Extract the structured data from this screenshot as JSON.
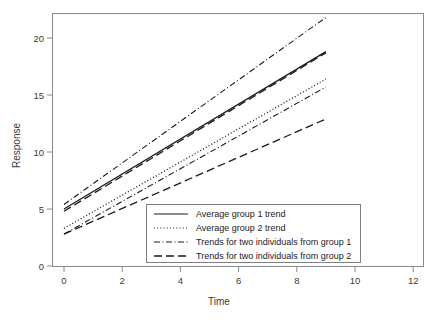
{
  "chart_data": {
    "type": "line",
    "title": "",
    "xlabel": "Time",
    "ylabel": "Response",
    "xlim": [
      -0.45,
      12.8
    ],
    "ylim": [
      -0.9,
      22.4
    ],
    "xticks": [
      0,
      2,
      4,
      6,
      8,
      10,
      12
    ],
    "yticks": [
      0,
      5,
      10,
      15,
      20
    ],
    "grid": false,
    "legend_position": "lower center",
    "x": [
      0,
      9
    ],
    "series": [
      {
        "name": "Average group 1 trend",
        "style": "solid",
        "values": [
          5.0,
          18.8
        ]
      },
      {
        "name": "Average group 2 trend",
        "style": "dotted",
        "values": [
          3.3,
          16.4
        ]
      },
      {
        "name": "Trends for two individuals from group 1",
        "style": "dash-dot",
        "values": [
          5.4,
          21.8
        ]
      },
      {
        "name": "Trends for two individuals from group 1",
        "style": "dash-dot",
        "values": [
          2.8,
          15.7
        ]
      },
      {
        "name": "Trends for two individuals from group 2",
        "style": "dashed",
        "values": [
          4.8,
          18.7
        ]
      },
      {
        "name": "Trends for two individuals from group 2",
        "style": "dashed",
        "values": [
          2.8,
          12.9
        ]
      }
    ],
    "legend": [
      {
        "label": "Average group 1 trend",
        "style": "solid"
      },
      {
        "label": "Average group 2 trend",
        "style": "dotted"
      },
      {
        "label": "Trends for two individuals from group 1",
        "style": "dash-dot"
      },
      {
        "label": "Trends for two individuals from group 2",
        "style": "dashed"
      }
    ],
    "line_color": "#1a1a1a",
    "frame_color": "#888888"
  },
  "xtick_labels": [
    "0",
    "2",
    "4",
    "6",
    "8",
    "10",
    "12"
  ],
  "ytick_labels": [
    "0",
    "5",
    "10",
    "15",
    "20"
  ],
  "axis": {
    "xlabel": "Time",
    "ylabel": "Response"
  },
  "legend_labels": {
    "row0": "Average group 1 trend",
    "row1": "Average group 2 trend",
    "row2": "Trends for two individuals from group 1",
    "row3": "Trends for two individuals from group 2"
  }
}
